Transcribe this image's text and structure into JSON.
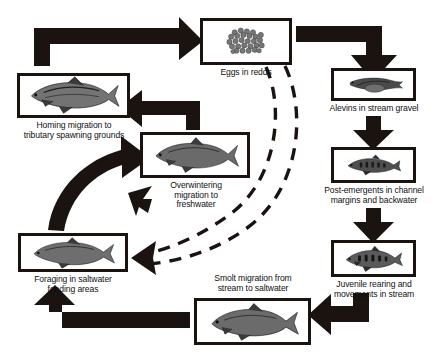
{
  "diagram": {
    "type": "cycle-flow-diagram",
    "background_color": "#ffffff",
    "ink_color": "#1a1310",
    "text_color": "#111111"
  },
  "nodes": [
    {
      "id": "eggs",
      "label": "Eggs in redds",
      "label_position": "below",
      "image": "egg-cluster-illustration",
      "box": {
        "x": 200,
        "y": 18,
        "w": 92,
        "h": 47
      }
    },
    {
      "id": "alevins",
      "label": "Alevins in stream gravel",
      "label_position": "below",
      "image": "alevin-fish-illustration",
      "box": {
        "x": 331,
        "y": 68,
        "w": 85,
        "h": 33
      }
    },
    {
      "id": "post-emergents",
      "label": "Post-emergents in channel\nmargins and backwater",
      "label_position": "below",
      "image": "post-emergent-fry-illustration",
      "box": {
        "x": 331,
        "y": 147,
        "w": 85,
        "h": 36
      }
    },
    {
      "id": "juvenile",
      "label": "Juvenile rearing and\nmovements in stream",
      "label_position": "below",
      "image": "juvenile-parr-illustration",
      "box": {
        "x": 331,
        "y": 240,
        "w": 85,
        "h": 37
      }
    },
    {
      "id": "smolt",
      "label": "Smolt migration from\nstream to saltwater",
      "label_position": "above",
      "image": "smolt-fish-illustration",
      "box": {
        "x": 194,
        "y": 298,
        "w": 117,
        "h": 47
      }
    },
    {
      "id": "foraging",
      "label": "Foraging in saltwater\nfeeding areas",
      "label_position": "below",
      "image": "saltwater-adult-fish-illustration",
      "box": {
        "x": 18,
        "y": 233,
        "w": 110,
        "h": 39
      }
    },
    {
      "id": "overwintering",
      "label": "Overwintering\nmigration to\nfreshwater",
      "label_position": "below",
      "image": "overwintering-trout-illustration",
      "box": {
        "x": 140,
        "y": 132,
        "w": 110,
        "h": 46
      }
    },
    {
      "id": "homing",
      "label": "Homing migration to\ntributary spawning grounds",
      "label_position": "below",
      "image": "spawning-adult-trout-illustration",
      "box": {
        "x": 17,
        "y": 73,
        "w": 113,
        "h": 45
      }
    }
  ],
  "connections": [
    {
      "from": "homing",
      "to": "eggs",
      "style": "solid-block-arrow",
      "shape": "up-then-right"
    },
    {
      "from": "eggs",
      "to": "alevins",
      "style": "solid-block-arrow",
      "shape": "right-then-down"
    },
    {
      "from": "alevins",
      "to": "post-emergents",
      "style": "solid-block-arrow",
      "shape": "down"
    },
    {
      "from": "post-emergents",
      "to": "juvenile",
      "style": "solid-block-arrow",
      "shape": "down"
    },
    {
      "from": "juvenile",
      "to": "smolt",
      "style": "solid-block-arrow",
      "shape": "down-then-left"
    },
    {
      "from": "smolt",
      "to": "foraging",
      "style": "solid-block-arrow",
      "shape": "left-then-up"
    },
    {
      "from": "foraging",
      "to": "overwintering",
      "style": "curved-block-arrow",
      "shape": "curve-up-right"
    },
    {
      "from": "overwintering",
      "to": "homing",
      "style": "solid-block-arrow",
      "shape": "up-then-left"
    },
    {
      "from": "overwintering",
      "to": "foraging",
      "style": "small-block-arrow",
      "shape": "down-left"
    },
    {
      "from": "eggs",
      "to": "foraging",
      "style": "dashed-arc-arrow",
      "shape": "outer-arc-left"
    },
    {
      "from": "eggs",
      "to": "foraging",
      "style": "dashed-arc-arrow",
      "shape": "inner-arc-left"
    }
  ]
}
